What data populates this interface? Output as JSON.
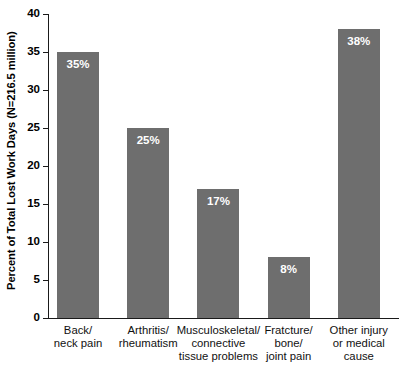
{
  "chart_data": {
    "type": "bar",
    "title": "",
    "xlabel": "",
    "ylabel": "Percent of Total Lost Work Days (N=216.5 million)",
    "ylim": [
      0,
      40
    ],
    "yticks": [
      0,
      5,
      10,
      15,
      20,
      25,
      30,
      35,
      40
    ],
    "ytick_labels": [
      "0",
      "5",
      "10",
      "15",
      "20",
      "25",
      "30",
      "35",
      "40"
    ],
    "grid": false,
    "legend": null,
    "bar_color": "#6e6e6e",
    "value_label_color": "#ffffff",
    "axis_color": "#1a1a1a",
    "categories": [
      "Back/\nneck pain",
      "Arthritis/\nrheumatism",
      "Musculoskeletal/\nconnective\ntissue problems",
      "Fratcture/\nbone/\njoint pain",
      "Other injury\nor medical\ncause"
    ],
    "category_lines": [
      [
        "Back/",
        "neck pain"
      ],
      [
        "Arthritis/",
        "rheumatism"
      ],
      [
        "Musculoskeletal/",
        "connective",
        "tissue problems"
      ],
      [
        "Fratcture/",
        "bone/",
        "joint pain"
      ],
      [
        "Other injury",
        "or medical",
        "cause"
      ]
    ],
    "values": [
      35,
      25,
      17,
      8,
      38
    ],
    "value_labels": [
      "35%",
      "25%",
      "17%",
      "8%",
      "38%"
    ]
  }
}
